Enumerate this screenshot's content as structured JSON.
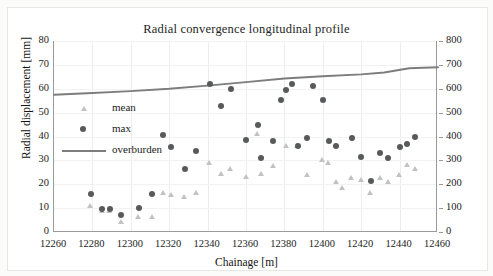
{
  "chart_data": {
    "type": "scatter",
    "title": "Radial convergence longitudinal profile",
    "xlabel": "Chainage [m]",
    "ylabel": "Radial displacement [mm]",
    "y2label": "Overburden [m]",
    "xlim": [
      12260,
      12460
    ],
    "ylim": [
      0,
      80
    ],
    "y2lim": [
      0,
      800
    ],
    "xticks": [
      12260,
      12280,
      12300,
      12320,
      12340,
      12360,
      12380,
      12400,
      12420,
      12440,
      12460
    ],
    "yticks": [
      0,
      10,
      20,
      30,
      40,
      50,
      60,
      70,
      80
    ],
    "y2ticks": [
      0,
      100,
      200,
      300,
      400,
      500,
      600,
      700,
      800
    ],
    "grid": true,
    "legend_position": "upper left",
    "series": [
      {
        "name": "mean",
        "marker": "triangle",
        "color": "#c2c2c2",
        "axis": "left",
        "points": [
          [
            12279,
            11.0
          ],
          [
            12285,
            9.0
          ],
          [
            12289,
            9.0
          ],
          [
            12295,
            4.0
          ],
          [
            12304,
            6.5
          ],
          [
            12311,
            6.5
          ],
          [
            12317,
            16.5
          ],
          [
            12321,
            15.5
          ],
          [
            12328,
            14.5
          ],
          [
            12334,
            16.5
          ],
          [
            12341,
            29.0
          ],
          [
            12347,
            24.5
          ],
          [
            12352,
            26.5
          ],
          [
            12360,
            23.0
          ],
          [
            12366,
            41.0
          ],
          [
            12368,
            24.5
          ],
          [
            12374,
            27.5
          ],
          [
            12381,
            36.0
          ],
          [
            12387,
            36.0
          ],
          [
            12392,
            24.0
          ],
          [
            12400,
            30.0
          ],
          [
            12403,
            29.0
          ],
          [
            12407,
            21.0
          ],
          [
            12410,
            18.5
          ],
          [
            12415,
            22.5
          ],
          [
            12420,
            22.0
          ],
          [
            12425,
            16.5
          ],
          [
            12430,
            22.5
          ],
          [
            12434,
            21.0
          ],
          [
            12440,
            24.0
          ],
          [
            12444,
            28.0
          ],
          [
            12448,
            26.5
          ]
        ]
      },
      {
        "name": "max",
        "marker": "circle",
        "color": "#58595b",
        "axis": "left",
        "points": [
          [
            12279,
            16.0
          ],
          [
            12285,
            9.5
          ],
          [
            12289,
            9.5
          ],
          [
            12295,
            7.0
          ],
          [
            12304,
            10.0
          ],
          [
            12311,
            16.0
          ],
          [
            12317,
            40.5
          ],
          [
            12321,
            35.5
          ],
          [
            12328,
            26.5
          ],
          [
            12334,
            34.0
          ],
          [
            12341,
            62.0
          ],
          [
            12347,
            53.0
          ],
          [
            12352,
            60.0
          ],
          [
            12360,
            38.5
          ],
          [
            12366,
            45.0
          ],
          [
            12368,
            31.0
          ],
          [
            12374,
            38.0
          ],
          [
            12378,
            55.5
          ],
          [
            12381,
            59.5
          ],
          [
            12384,
            62.0
          ],
          [
            12387,
            36.0
          ],
          [
            12392,
            39.5
          ],
          [
            12395,
            61.0
          ],
          [
            12400,
            55.5
          ],
          [
            12403,
            38.0
          ],
          [
            12407,
            36.0
          ],
          [
            12415,
            39.5
          ],
          [
            12420,
            31.5
          ],
          [
            12425,
            21.5
          ],
          [
            12430,
            33.0
          ],
          [
            12434,
            31.0
          ],
          [
            12440,
            35.5
          ],
          [
            12444,
            37.0
          ],
          [
            12448,
            40.0
          ]
        ]
      },
      {
        "name": "overburden",
        "marker": "line",
        "color": "#7d7d7d",
        "axis": "right",
        "points": [
          [
            12260,
            575
          ],
          [
            12280,
            582
          ],
          [
            12300,
            590
          ],
          [
            12320,
            600
          ],
          [
            12340,
            613
          ],
          [
            12360,
            628
          ],
          [
            12380,
            643
          ],
          [
            12400,
            652
          ],
          [
            12420,
            660
          ],
          [
            12432,
            668
          ],
          [
            12445,
            686
          ],
          [
            12460,
            690
          ]
        ]
      }
    ],
    "legend": [
      {
        "label": "mean",
        "marker": "triangle"
      },
      {
        "label": "max",
        "marker": "circle"
      },
      {
        "label": "overburden",
        "marker": "line"
      }
    ]
  }
}
